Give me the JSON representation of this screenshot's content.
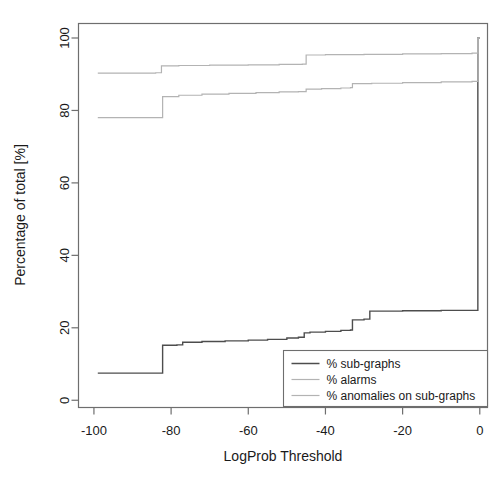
{
  "chart_data": {
    "type": "line",
    "title": "",
    "subtitle": "",
    "xlabel": "LogProb Threshold",
    "ylabel": "Percentage of total [%]",
    "xlim": [
      -104,
      2
    ],
    "ylim": [
      -2,
      104
    ],
    "xticks": [
      -100,
      -80,
      -60,
      -40,
      -20,
      0
    ],
    "xtick_labels": [
      "-100",
      "-80",
      "-60",
      "-40",
      "-20",
      "0"
    ],
    "yticks": [
      0,
      20,
      40,
      60,
      80,
      100
    ],
    "ytick_labels": [
      "0",
      "20",
      "40",
      "60",
      "80",
      "100"
    ],
    "grid": false,
    "legend_position": "bottom-right",
    "step_style": "post",
    "series": [
      {
        "name": "% sub-graphs",
        "color": "#4d4d4d",
        "width": 1.4,
        "points": [
          [
            -99.0,
            7.5
          ],
          [
            -83.0,
            7.5
          ],
          [
            -82.2,
            15.2
          ],
          [
            -78.5,
            15.3
          ],
          [
            -77.0,
            16.0
          ],
          [
            -72.0,
            16.2
          ],
          [
            -66.0,
            16.4
          ],
          [
            -60.0,
            16.6
          ],
          [
            -55.0,
            16.8
          ],
          [
            -50.0,
            17.2
          ],
          [
            -47.0,
            17.4
          ],
          [
            -45.5,
            18.6
          ],
          [
            -44.0,
            18.8
          ],
          [
            -40.0,
            19.0
          ],
          [
            -36.0,
            19.3
          ],
          [
            -33.5,
            19.4
          ],
          [
            -33.0,
            22.2
          ],
          [
            -30.0,
            22.4
          ],
          [
            -28.5,
            24.6
          ],
          [
            -20.0,
            24.7
          ],
          [
            -10.0,
            24.8
          ],
          [
            -2.0,
            24.8
          ],
          [
            -0.6,
            24.8
          ],
          [
            -0.5,
            100.0
          ],
          [
            0.0,
            100.0
          ]
        ]
      },
      {
        "name": "% alarms",
        "color": "#b3b3b3",
        "width": 1.2,
        "points": [
          [
            -99.0,
            78.0
          ],
          [
            -83.0,
            78.0
          ],
          [
            -82.2,
            83.8
          ],
          [
            -78.0,
            84.2
          ],
          [
            -72.0,
            84.5
          ],
          [
            -65.0,
            84.7
          ],
          [
            -58.0,
            84.9
          ],
          [
            -52.0,
            85.1
          ],
          [
            -47.0,
            85.2
          ],
          [
            -45.0,
            85.9
          ],
          [
            -41.0,
            86.0
          ],
          [
            -36.0,
            86.2
          ],
          [
            -33.5,
            86.3
          ],
          [
            -33.0,
            87.4
          ],
          [
            -28.0,
            87.5
          ],
          [
            -20.0,
            87.7
          ],
          [
            -10.0,
            87.9
          ],
          [
            -2.0,
            88.0
          ],
          [
            -0.6,
            88.0
          ],
          [
            -0.5,
            100.0
          ],
          [
            0.0,
            100.0
          ]
        ]
      },
      {
        "name": "% anomalies on sub-graphs",
        "color": "#b3b3b3",
        "width": 1.2,
        "points": [
          [
            -99.0,
            90.3
          ],
          [
            -84.0,
            90.4
          ],
          [
            -82.5,
            92.3
          ],
          [
            -78.0,
            92.4
          ],
          [
            -70.0,
            92.5
          ],
          [
            -60.0,
            92.6
          ],
          [
            -52.0,
            92.7
          ],
          [
            -46.0,
            92.8
          ],
          [
            -45.0,
            95.3
          ],
          [
            -40.0,
            95.4
          ],
          [
            -30.0,
            95.5
          ],
          [
            -20.0,
            95.6
          ],
          [
            -10.0,
            95.7
          ],
          [
            -2.0,
            95.8
          ],
          [
            -0.6,
            95.8
          ],
          [
            -0.5,
            100.0
          ],
          [
            0.0,
            100.0
          ]
        ]
      }
    ],
    "legend": [
      {
        "label": "% sub-graphs",
        "color": "#4d4d4d"
      },
      {
        "label": "% alarms",
        "color": "#b3b3b3"
      },
      {
        "label": "% anomalies on sub-graphs",
        "color": "#b3b3b3"
      }
    ],
    "annotations": []
  }
}
